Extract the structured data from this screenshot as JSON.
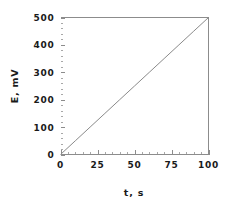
{
  "figure": {
    "background_color": "#ffffff",
    "frame_color": "#8c8c8c",
    "text_color": "#1a1a1a"
  },
  "axes": {
    "x_title": "t,  s",
    "y_title": "E,  mV",
    "x_tick_labels": [
      "0",
      "25",
      "50",
      "75",
      "100"
    ],
    "y_tick_labels": [
      "0",
      "100",
      "200",
      "300",
      "400",
      "500"
    ]
  },
  "chart_data": {
    "type": "line",
    "title": "",
    "subtitle": "",
    "xlabel": "t, s",
    "ylabel": "E, mV",
    "xlim": [
      0,
      100
    ],
    "ylim": [
      0,
      500
    ],
    "xticks": [
      0,
      25,
      50,
      75,
      100
    ],
    "yticks": [
      0,
      100,
      200,
      300,
      400,
      500
    ],
    "x_minor_tick_interval": 5,
    "y_minor_tick_interval": 20,
    "grid": false,
    "legend": null,
    "legend_position": "none",
    "annotations": [],
    "series": [
      {
        "name": "E vs t",
        "color": "#8a8a8a",
        "linewidth": 1,
        "marker": "none",
        "slope": 5,
        "intercept": 0,
        "x": [
          0,
          10,
          20,
          30,
          40,
          50,
          60,
          70,
          80,
          90,
          100
        ],
        "values": [
          0,
          50,
          100,
          150,
          200,
          250,
          300,
          350,
          400,
          450,
          500
        ]
      }
    ]
  }
}
